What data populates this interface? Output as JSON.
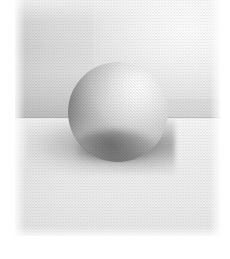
{
  "artwork": {
    "title": "Graphite Sphere Study",
    "medium": "Graphite pencil on textured paper",
    "subject": "sphere",
    "caption": "",
    "canvas": {
      "width_px": 230,
      "height_px": 259
    },
    "page_margin": {
      "color": "#ffffff",
      "left_px": 15,
      "right_px": 10,
      "top_px": 0,
      "bottom_px": 23
    },
    "scene": {
      "backdrop_label": "backdrop plane",
      "ground_label": "ground plane",
      "horizon_y_px": 118,
      "light_direction": "upper-right",
      "backdrop_color_light": "#f6f6f6",
      "backdrop_color_dark": "#c4c4c4",
      "ground_color_light": "#f7f7f7",
      "ground_color_dark": "#dcdcdc",
      "horizon_line_color": "#969696"
    },
    "sphere": {
      "label": "sphere",
      "center_x_px": 118,
      "center_y_px": 112,
      "radius_px": 50,
      "highlight_color": "#ffffff",
      "midtone_color": "#c6c6c6",
      "core_shadow_color": "#8c8c8c",
      "reflected_light_color": "#e8e8e8",
      "highlight_position": "upper-right"
    },
    "cast_shadow": {
      "label": "cast shadow",
      "color": "#5c5c5c",
      "direction": "lower-left",
      "extent_x_px": 148,
      "extent_y_px": 54
    },
    "texture": {
      "label": "paper tooth grain",
      "opacity": 0.3
    }
  }
}
